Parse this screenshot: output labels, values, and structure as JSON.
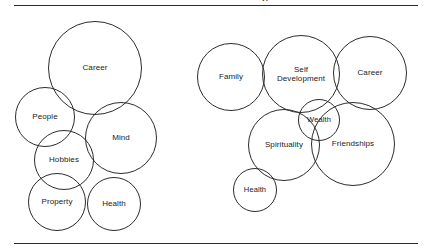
{
  "page": {
    "background_color": "#ffffff",
    "line_color": "#2c2c2c",
    "text_color": "#1a1a1a",
    "title_fragment": "p"
  },
  "rules": {
    "top_label": "top-divider",
    "bottom_label": "bottom-divider"
  },
  "diagram": {
    "type": "bubble-cluster",
    "clusters": [
      {
        "name": "left-cluster",
        "bubbles": [
          {
            "label": "Career",
            "cx": 95,
            "cy": 62,
            "r": 47
          },
          {
            "label": "People",
            "cx": 45,
            "cy": 111,
            "r": 30
          },
          {
            "label": "Mind",
            "cx": 121,
            "cy": 132,
            "r": 36
          },
          {
            "label": "Hobbies",
            "cx": 64,
            "cy": 154,
            "r": 30
          },
          {
            "label": "Property",
            "cx": 57,
            "cy": 196,
            "r": 29
          },
          {
            "label": "Health",
            "cx": 114,
            "cy": 198,
            "r": 27
          }
        ]
      },
      {
        "name": "right-cluster",
        "bubbles": [
          {
            "label": "Family",
            "cx": 231,
            "cy": 71,
            "r": 34
          },
          {
            "label": "Self\nDevelopment",
            "cx": 301,
            "cy": 68,
            "r": 39
          },
          {
            "label": "Career",
            "cx": 370,
            "cy": 67,
            "r": 37
          },
          {
            "label": "Wealth",
            "cx": 319,
            "cy": 114,
            "r": 21
          },
          {
            "label": "Friendships",
            "cx": 353,
            "cy": 138,
            "r": 42
          },
          {
            "label": "Spirituality",
            "cx": 284,
            "cy": 139,
            "r": 36
          },
          {
            "label": "Health",
            "cx": 255,
            "cy": 184,
            "r": 22
          }
        ]
      }
    ]
  }
}
